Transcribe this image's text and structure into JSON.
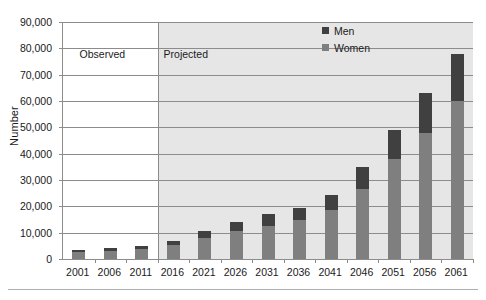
{
  "chart_data": {
    "type": "bar",
    "subtype": "stacked-vertical",
    "title": "",
    "xlabel": "",
    "ylabel": "Number",
    "ylim": [
      0,
      90000
    ],
    "ytick_interval": 10000,
    "ytick_labels": [
      "0",
      "10,000",
      "20,000",
      "30,000",
      "40,000",
      "50,000",
      "60,000",
      "70,000",
      "80,000",
      "90,000"
    ],
    "ytick_values": [
      0,
      10000,
      20000,
      30000,
      40000,
      50000,
      60000,
      70000,
      80000,
      90000
    ],
    "grid": true,
    "grid_axis": "y",
    "legend_position": "top-right",
    "categories": [
      "2001",
      "2006",
      "2011",
      "2016",
      "2021",
      "2026",
      "2031",
      "2036",
      "2041",
      "2046",
      "2051",
      "2056",
      "2061"
    ],
    "series": [
      {
        "name": "Women",
        "color": "#7f7f7f",
        "values": [
          2600,
          3000,
          3700,
          5200,
          7800,
          10500,
          12700,
          14700,
          18500,
          26500,
          38000,
          48000,
          60000
        ]
      },
      {
        "name": "Men",
        "color": "#404040",
        "values": [
          900,
          1000,
          1300,
          1800,
          2700,
          3500,
          4300,
          4800,
          6000,
          8500,
          11000,
          15000,
          18000
        ]
      }
    ],
    "totals": [
      3500,
      4000,
      5000,
      7000,
      10500,
      14000,
      17000,
      19500,
      24500,
      35000,
      49000,
      63000,
      78000
    ],
    "annotations": [
      {
        "name": "observed",
        "label": "Observed",
        "span": [
          "2001",
          "2011"
        ]
      },
      {
        "name": "projected",
        "label": "Projected",
        "span": [
          "2016",
          "2061"
        ]
      }
    ],
    "divider_after_category": "2011"
  },
  "axes": {
    "y_title": "Number"
  },
  "legend": {
    "items": [
      {
        "label": "Men",
        "color": "#404040"
      },
      {
        "label": "Women",
        "color": "#7f7f7f"
      }
    ]
  },
  "periods": {
    "observed_label": "Observed",
    "projected_label": "Projected"
  },
  "colors": {
    "men": "#404040",
    "women": "#7f7f7f",
    "projected_band": "#e6e6e6",
    "observed_band": "#ffffff",
    "gridline": "#8c8c8c",
    "axis": "#8c8c8c",
    "text": "#1a1a1a"
  }
}
